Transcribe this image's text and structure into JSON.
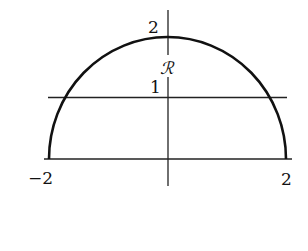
{
  "diagram": {
    "type": "region-in-plane",
    "region_label": "ℛ",
    "x_ticks": [
      {
        "value": -2,
        "label": "−2"
      },
      {
        "value": 2,
        "label": "2"
      }
    ],
    "y_ticks": [
      {
        "value": 1,
        "label": "1"
      },
      {
        "value": 2,
        "label": "2"
      }
    ],
    "curve": {
      "shape": "semi-ellipse",
      "x_intercepts": [
        -2,
        2
      ],
      "y_max": 2
    },
    "horizontal_lines": [
      {
        "y": 0,
        "role": "x-axis"
      },
      {
        "y": 1,
        "role": "line-y-equals-1"
      }
    ],
    "colors": {
      "stroke": "#111111",
      "background": "#ffffff"
    }
  }
}
